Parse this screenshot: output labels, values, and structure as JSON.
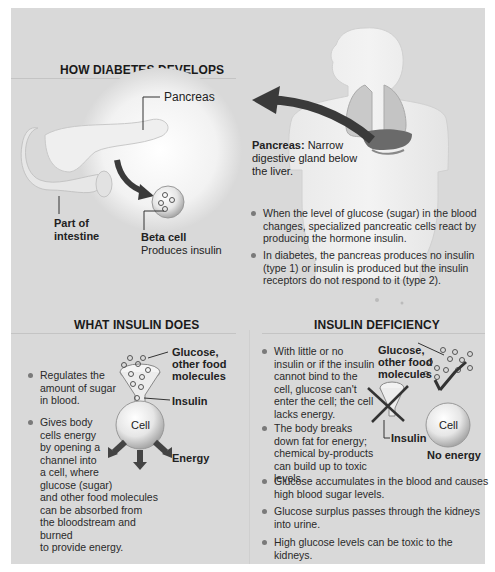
{
  "sections": {
    "how": {
      "title": "HOW DIABETES DEVELOPS",
      "labels": {
        "pancreas": "Pancreas",
        "intestine_line1": "Part of",
        "intestine_line2": "intestine",
        "beta_cell": "Beta cell",
        "beta_cell_desc": "Produces insulin",
        "pancreas_def_term": "Pancreas:",
        "pancreas_def_line1": "Narrow",
        "pancreas_def_line2": "digestive gland below",
        "pancreas_def_line3": "the liver."
      },
      "bullets": [
        {
          "lines": [
            "When the level of glucose (sugar) in the blood",
            "changes, specialized pancreatic cells react by",
            "producing the hormone insulin."
          ]
        },
        {
          "lines": [
            "In diabetes, the pancreas produces no insulin",
            "(type 1) or insulin is produced but the insulin",
            "receptors do not respond to it (type 2)."
          ]
        }
      ]
    },
    "what": {
      "title": "WHAT INSULIN DOES",
      "labels": {
        "glucose_line1": "Glucose,",
        "glucose_line2": "other food",
        "glucose_line3": "molecules",
        "insulin": "Insulin",
        "cell": "Cell",
        "energy": "Energy"
      },
      "bullets": [
        {
          "lines": [
            "Regulates the",
            "amount of sugar",
            "in blood."
          ]
        },
        {
          "lines": [
            "Gives body",
            "cells energy",
            "by opening a",
            "channel into",
            "a cell, where",
            "glucose (sugar)",
            "and other food molecules",
            "can be absorbed from",
            "the bloodstream and burned",
            "to provide energy."
          ]
        }
      ]
    },
    "deficiency": {
      "title": "INSULIN DEFICIENCY",
      "labels": {
        "glucose_line1": "Glucose,",
        "glucose_line2": "other food",
        "glucose_line3": "molecules",
        "insulin": "Insulin",
        "cell": "Cell",
        "no_energy": "No energy"
      },
      "bullets": [
        {
          "lines": [
            "With little or no",
            "insulin or if the insulin",
            "cannot bind to the",
            "cell, glucose can't",
            "enter the cell; the cell",
            "lacks energy."
          ]
        },
        {
          "lines": [
            "The body breaks",
            "down fat for energy;",
            "chemical by-products",
            "can build up to toxic levels."
          ]
        },
        {
          "lines": [
            "Glucose accumulates in the blood and causes",
            "high blood sugar levels."
          ]
        },
        {
          "lines": [
            "Glucose surplus passes through the kidneys",
            "into urine."
          ]
        },
        {
          "lines": [
            "High glucose levels can be toxic to the kidneys."
          ]
        }
      ]
    }
  },
  "colors": {
    "background": "#d9d9d9",
    "text": "#1a1a1a",
    "arrow": "#3a3a3a",
    "bullet": "#7a7a7a"
  }
}
